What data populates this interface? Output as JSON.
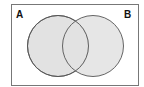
{
  "diagram": {
    "type": "venn",
    "sets": [
      {
        "label": "A",
        "fill": "#e2e2e2",
        "stroke": "#555555"
      },
      {
        "label": "B",
        "fill": "#e2e2e2",
        "stroke": "#555555"
      }
    ],
    "frame": {
      "stroke": "#777777",
      "fill": "#ffffff"
    }
  }
}
